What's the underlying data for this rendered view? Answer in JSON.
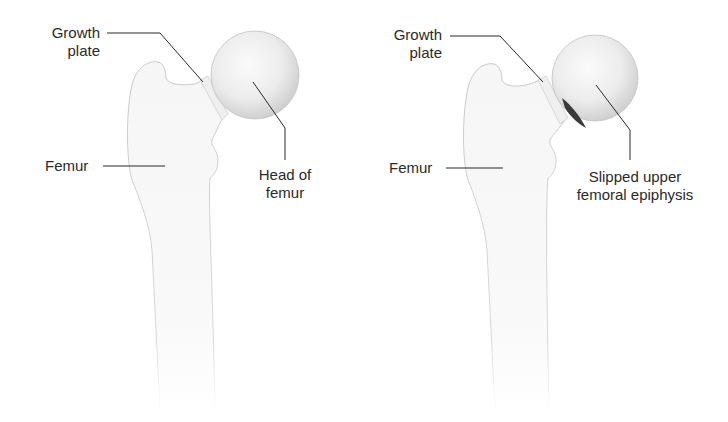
{
  "diagram": {
    "panels": [
      {
        "id": "normal",
        "labels": {
          "growth_plate_1": "Growth",
          "growth_plate_2": "plate",
          "femur": "Femur",
          "head_1": "Head of",
          "head_2": "femur"
        }
      },
      {
        "id": "slipped",
        "labels": {
          "growth_plate_1": "Growth",
          "growth_plate_2": "plate",
          "femur": "Femur",
          "slipped_1": "Slipped upper",
          "slipped_2": "femoral epiphysis"
        }
      }
    ],
    "colors": {
      "bone_fill": "#f7f7f7",
      "bone_outline": "#cfcfcf",
      "head_shade": "#d9d9d9",
      "leader_line": "#2a2a2a",
      "slip_gap": "#3a3a3a"
    }
  }
}
